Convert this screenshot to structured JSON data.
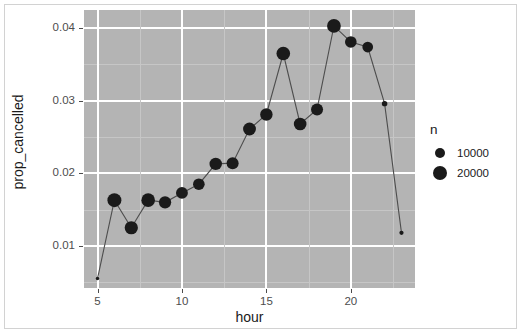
{
  "chart_data": {
    "type": "scatter",
    "title": "",
    "xlabel": "hour",
    "ylabel": "prop_cancelled",
    "xlim": [
      4.2,
      23.8
    ],
    "ylim": [
      0.0042,
      0.0425
    ],
    "grid": true,
    "legend_position": "right",
    "x": [
      5,
      6,
      7,
      8,
      9,
      10,
      11,
      12,
      13,
      14,
      15,
      16,
      17,
      18,
      19,
      20,
      21,
      22,
      23
    ],
    "y": [
      0.0055,
      0.0163,
      0.0125,
      0.0163,
      0.016,
      0.0173,
      0.0185,
      0.0213,
      0.0214,
      0.0261,
      0.0281,
      0.0365,
      0.0268,
      0.0288,
      0.0403,
      0.0381,
      0.0374,
      0.0296,
      0.0118
    ],
    "size_values": [
      1200,
      19500,
      17500,
      18500,
      15000,
      14000,
      13500,
      15500,
      14500,
      16500,
      15500,
      18500,
      16000,
      14500,
      19000,
      13500,
      11500,
      3000,
      1800
    ],
    "xticks": [
      5,
      10,
      15,
      20
    ],
    "xtick_labels": [
      "5",
      "10",
      "15",
      "20"
    ],
    "yticks": [
      0.01,
      0.02,
      0.03,
      0.04
    ],
    "ytick_labels": [
      "0.01",
      "0.02",
      "0.03",
      "0.04"
    ],
    "series_name": "prop_cancelled",
    "point_color": "#1a1a1a",
    "line_color": "#4d4d4d",
    "panel_color": "#b4b4b4",
    "grid_color": "#ffffff"
  },
  "legend": {
    "title": "n",
    "items": [
      {
        "label": "10000",
        "radius": 5.0
      },
      {
        "label": "20000",
        "radius": 7.0
      }
    ]
  },
  "axes": {
    "x_title": "hour",
    "y_title": "prop_cancelled"
  }
}
